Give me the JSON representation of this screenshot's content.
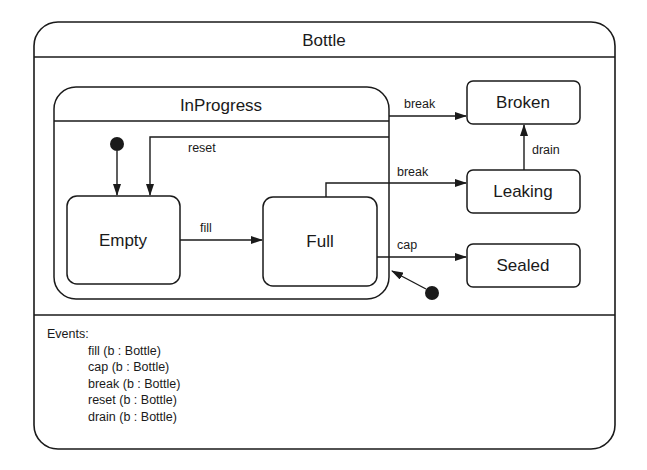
{
  "diagram": {
    "title": "Bottle",
    "composite_state": "InProgress",
    "states": {
      "empty": "Empty",
      "full": "Full",
      "broken": "Broken",
      "leaking": "Leaking",
      "sealed": "Sealed"
    },
    "transitions": {
      "fill": "fill",
      "reset": "reset",
      "break_inprogress": "break",
      "break_full": "break",
      "cap": "cap",
      "drain": "drain"
    },
    "colors": {
      "stroke": "#1a1a1a",
      "background": "#ffffff"
    }
  },
  "events": {
    "heading": "Events:",
    "items": [
      "fill (b : Bottle)",
      "cap (b : Bottle)",
      "break (b : Bottle)",
      "reset (b : Bottle)",
      "drain (b : Bottle)"
    ]
  }
}
